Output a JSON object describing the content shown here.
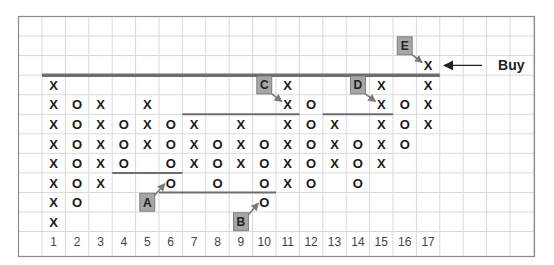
{
  "chart_data": {
    "type": "point-and-figure",
    "title": "",
    "xlabel": "",
    "ylabel": "",
    "columns": [
      "1",
      "2",
      "3",
      "4",
      "5",
      "6",
      "7",
      "8",
      "9",
      "10",
      "11",
      "12",
      "13",
      "14",
      "15",
      "16",
      "17"
    ],
    "levels_from_top": 11,
    "grid": true,
    "colors": {
      "grid": "#d9d9d9",
      "border": "#8c8c8c",
      "trendline": "#6e6e6e",
      "label_box": "#a6a6a6",
      "arrow": "#7a7a7a",
      "text": "#1a1a1a"
    },
    "marks": [
      {
        "col": 17,
        "row": 2,
        "sym": "X"
      },
      {
        "col": 1,
        "row": 3,
        "sym": "X"
      },
      {
        "col": 11,
        "row": 3,
        "sym": "X"
      },
      {
        "col": 15,
        "row": 3,
        "sym": "X"
      },
      {
        "col": 17,
        "row": 3,
        "sym": "X"
      },
      {
        "col": 1,
        "row": 4,
        "sym": "X"
      },
      {
        "col": 2,
        "row": 4,
        "sym": "O"
      },
      {
        "col": 3,
        "row": 4,
        "sym": "X"
      },
      {
        "col": 5,
        "row": 4,
        "sym": "X"
      },
      {
        "col": 11,
        "row": 4,
        "sym": "X"
      },
      {
        "col": 12,
        "row": 4,
        "sym": "O"
      },
      {
        "col": 15,
        "row": 4,
        "sym": "X"
      },
      {
        "col": 16,
        "row": 4,
        "sym": "O"
      },
      {
        "col": 17,
        "row": 4,
        "sym": "X"
      },
      {
        "col": 1,
        "row": 5,
        "sym": "X"
      },
      {
        "col": 2,
        "row": 5,
        "sym": "O"
      },
      {
        "col": 3,
        "row": 5,
        "sym": "X"
      },
      {
        "col": 4,
        "row": 5,
        "sym": "O"
      },
      {
        "col": 5,
        "row": 5,
        "sym": "X"
      },
      {
        "col": 6,
        "row": 5,
        "sym": "O"
      },
      {
        "col": 7,
        "row": 5,
        "sym": "X"
      },
      {
        "col": 9,
        "row": 5,
        "sym": "X"
      },
      {
        "col": 11,
        "row": 5,
        "sym": "X"
      },
      {
        "col": 12,
        "row": 5,
        "sym": "O"
      },
      {
        "col": 13,
        "row": 5,
        "sym": "X"
      },
      {
        "col": 15,
        "row": 5,
        "sym": "X"
      },
      {
        "col": 16,
        "row": 5,
        "sym": "O"
      },
      {
        "col": 17,
        "row": 5,
        "sym": "X"
      },
      {
        "col": 1,
        "row": 6,
        "sym": "X"
      },
      {
        "col": 2,
        "row": 6,
        "sym": "O"
      },
      {
        "col": 3,
        "row": 6,
        "sym": "X"
      },
      {
        "col": 4,
        "row": 6,
        "sym": "O"
      },
      {
        "col": 5,
        "row": 6,
        "sym": "X"
      },
      {
        "col": 6,
        "row": 6,
        "sym": "O"
      },
      {
        "col": 7,
        "row": 6,
        "sym": "X"
      },
      {
        "col": 8,
        "row": 6,
        "sym": "O"
      },
      {
        "col": 9,
        "row": 6,
        "sym": "X"
      },
      {
        "col": 10,
        "row": 6,
        "sym": "O"
      },
      {
        "col": 11,
        "row": 6,
        "sym": "X"
      },
      {
        "col": 12,
        "row": 6,
        "sym": "O"
      },
      {
        "col": 13,
        "row": 6,
        "sym": "X"
      },
      {
        "col": 14,
        "row": 6,
        "sym": "O"
      },
      {
        "col": 15,
        "row": 6,
        "sym": "X"
      },
      {
        "col": 16,
        "row": 6,
        "sym": "O"
      },
      {
        "col": 1,
        "row": 7,
        "sym": "X"
      },
      {
        "col": 2,
        "row": 7,
        "sym": "O"
      },
      {
        "col": 3,
        "row": 7,
        "sym": "X"
      },
      {
        "col": 4,
        "row": 7,
        "sym": "O"
      },
      {
        "col": 6,
        "row": 7,
        "sym": "O"
      },
      {
        "col": 7,
        "row": 7,
        "sym": "X"
      },
      {
        "col": 8,
        "row": 7,
        "sym": "O"
      },
      {
        "col": 9,
        "row": 7,
        "sym": "X"
      },
      {
        "col": 10,
        "row": 7,
        "sym": "O"
      },
      {
        "col": 11,
        "row": 7,
        "sym": "X"
      },
      {
        "col": 12,
        "row": 7,
        "sym": "O"
      },
      {
        "col": 13,
        "row": 7,
        "sym": "X"
      },
      {
        "col": 14,
        "row": 7,
        "sym": "O"
      },
      {
        "col": 15,
        "row": 7,
        "sym": "X"
      },
      {
        "col": 1,
        "row": 8,
        "sym": "X"
      },
      {
        "col": 2,
        "row": 8,
        "sym": "O"
      },
      {
        "col": 3,
        "row": 8,
        "sym": "X"
      },
      {
        "col": 6,
        "row": 8,
        "sym": "O"
      },
      {
        "col": 8,
        "row": 8,
        "sym": "O"
      },
      {
        "col": 10,
        "row": 8,
        "sym": "O"
      },
      {
        "col": 11,
        "row": 8,
        "sym": "X"
      },
      {
        "col": 12,
        "row": 8,
        "sym": "O"
      },
      {
        "col": 14,
        "row": 8,
        "sym": "O"
      },
      {
        "col": 1,
        "row": 9,
        "sym": "X"
      },
      {
        "col": 2,
        "row": 9,
        "sym": "O"
      },
      {
        "col": 10,
        "row": 9,
        "sym": "O"
      },
      {
        "col": 1,
        "row": 10,
        "sym": "X"
      }
    ],
    "trendlines": [
      {
        "name": "resistance-main",
        "from_col": 1,
        "to_col": 17,
        "above_row": 3,
        "heavy": true
      },
      {
        "name": "resistance-c",
        "from_col": 7,
        "to_col": 11,
        "above_row": 5,
        "heavy": false
      },
      {
        "name": "resistance-d",
        "from_col": 13,
        "to_col": 15,
        "above_row": 5,
        "heavy": false
      },
      {
        "name": "support-a",
        "from_col": 4,
        "to_col": 6,
        "above_row": 8,
        "heavy": false
      },
      {
        "name": "support-b",
        "from_col": 6,
        "to_col": 10,
        "above_row": 9,
        "heavy": false
      }
    ],
    "annotations": [
      {
        "label": "A",
        "col": 5,
        "row": 9,
        "points_to": {
          "col": 6,
          "row": 8
        }
      },
      {
        "label": "B",
        "col": 9,
        "row": 10,
        "points_to": {
          "col": 10,
          "row": 9
        }
      },
      {
        "label": "C",
        "col": 10,
        "row": 3,
        "points_to": {
          "col": 11,
          "row": 4
        }
      },
      {
        "label": "D",
        "col": 14,
        "row": 3,
        "points_to": {
          "col": 15,
          "row": 4
        }
      },
      {
        "label": "E",
        "col": 16,
        "row": 1,
        "points_to": {
          "col": 17,
          "row": 2
        }
      }
    ],
    "signal": {
      "text": "Buy",
      "col": 17,
      "row": 2
    }
  }
}
